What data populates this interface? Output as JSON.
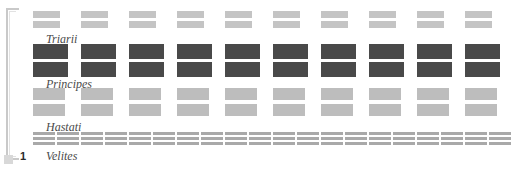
{
  "diagram": {
    "legion_number": "1",
    "bracket": "legion-bracket",
    "colors": {
      "triarii": "#c4c4c4",
      "principes": "#494949",
      "hastati": "#bdbdbd",
      "velites": "#a9a9a9",
      "bracket": "#c9c9c9",
      "label_text": "#4a4a4a",
      "background": "#ffffff"
    },
    "rows": [
      {
        "id": "triarii",
        "label": "Triarii",
        "unit_count": 10,
        "blocks_per_unit": 2,
        "color": "#c4c4c4"
      },
      {
        "id": "principes",
        "label": "Principes",
        "unit_count": 10,
        "blocks_per_unit": 2,
        "color": "#494949"
      },
      {
        "id": "hastati",
        "label": "Hastati",
        "unit_count": 10,
        "blocks_per_unit": 2,
        "color": "#bdbdbd"
      },
      {
        "id": "velites",
        "label": "Velites",
        "unit_count": 20,
        "blocks_per_unit": 3,
        "color": "#a9a9a9"
      }
    ]
  }
}
